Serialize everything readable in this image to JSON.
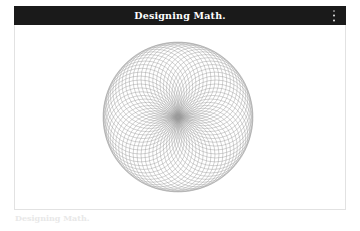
{
  "window": {
    "title": "Designing Math.",
    "menu_icon": "kebab-menu-icon",
    "header_bg": "#1a1a1a",
    "header_text_color": "#ffffff"
  },
  "caption": {
    "text": "Designing Math.",
    "color": "#e8e8e8"
  },
  "artwork": {
    "name": "spirograph-rotating-circles",
    "stroke_color": "#9a9a9a",
    "background": "#ffffff",
    "center_x": 163,
    "center_y": 92,
    "circle_count": 60,
    "circle_radius": 37,
    "orbit_radius": 38,
    "inner_hole_radius": 27,
    "outer_radius": 75,
    "stroke_width": 0.45
  },
  "chart_data": {
    "type": "scatter",
    "title": "Designing Math.",
    "xlabel": "",
    "ylabel": "",
    "parameters": {
      "n_circles": 60,
      "circle_radius": 37,
      "orbit_radius": 38,
      "angle_step_deg": 6
    },
    "legend": [],
    "grid": false
  }
}
